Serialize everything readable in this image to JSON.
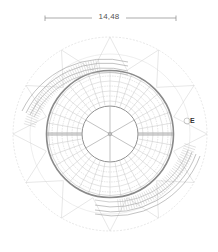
{
  "drawing": {
    "type": "circular plan",
    "dimension": {
      "label": "14,48"
    },
    "marker": {
      "label": "E"
    },
    "colors": {
      "line": "#9a9a9a",
      "light_line": "#d4d4d4",
      "heavy_line": "#7a7a7a",
      "background": "#ffffff"
    }
  }
}
